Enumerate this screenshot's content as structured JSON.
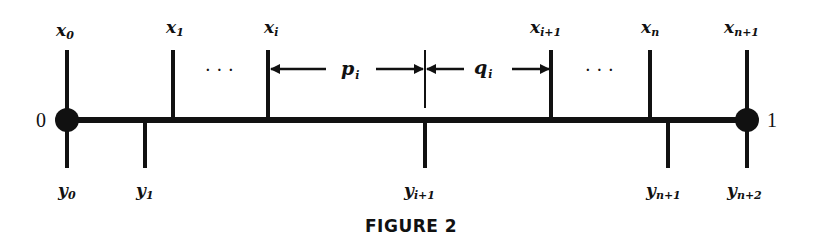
{
  "figure": {
    "caption": "FIGURE 2",
    "endpoints": {
      "left": "0",
      "right": "1"
    },
    "ellipsis": "· · ·",
    "x_ticks": [
      {
        "base": "x",
        "sub": "0"
      },
      {
        "base": "x",
        "sub": "1"
      },
      {
        "base": "x",
        "sub": "i"
      },
      {
        "base": "x",
        "sub": "i+1"
      },
      {
        "base": "x",
        "sub": "n"
      },
      {
        "base": "x",
        "sub": "n+1"
      }
    ],
    "y_ticks": [
      {
        "base": "y",
        "sub": "0"
      },
      {
        "base": "y",
        "sub": "1"
      },
      {
        "base": "y",
        "sub": "i+1"
      },
      {
        "base": "y",
        "sub": "n+1"
      },
      {
        "base": "y",
        "sub": "n+2"
      }
    ],
    "intervals": [
      {
        "base": "p",
        "sub": "i"
      },
      {
        "base": "q",
        "sub": "i"
      }
    ],
    "colors": {
      "ink": "#111111",
      "background": "#ffffff"
    }
  }
}
